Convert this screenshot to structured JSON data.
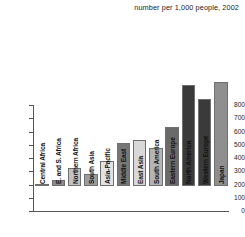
{
  "subtitle": "number per 1,000 people, 2002",
  "chart_data": {
    "type": "bar",
    "title": "",
    "subtitle": "number per 1,000 people, 2002",
    "xlabel": "",
    "ylabel": "",
    "ylim": [
      0,
      800
    ],
    "yticks": [
      0,
      100,
      200,
      300,
      400,
      500,
      600,
      700,
      800
    ],
    "ytick_labels": [
      "0",
      "100",
      "200",
      "300",
      "400",
      "500",
      "600",
      "700",
      "800"
    ],
    "grid": false,
    "legend": "none",
    "categories": [
      "Central Africa",
      "E. and S. Africa",
      "Northern Africa",
      "South Asia",
      "Asia-Pacific",
      "Middle East",
      "East Asia",
      "South America",
      "Eastern Europe",
      "North America",
      "Western Europe",
      "Japan"
    ],
    "values": [
      18,
      48,
      138,
      90,
      188,
      325,
      348,
      288,
      443,
      760,
      655,
      783
    ],
    "bar_colors": [
      "#6b6b6b",
      "#8a8a8a",
      "#c2c2c2",
      "#9d9d9d",
      "#e2e2e2",
      "#777777",
      "#d8d8d8",
      "#b5b5b5",
      "#6a6a6a",
      "#3a3a3a",
      "#3a3a3a",
      "#8f8f8f"
    ]
  }
}
